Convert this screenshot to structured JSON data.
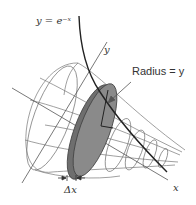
{
  "diagram": {
    "type": "solid-of-revolution",
    "labels": {
      "curve": "y = e⁻ˣ",
      "y_axis": "y",
      "x_axis": "x",
      "radius": "Radius = y",
      "delta_x": "Δx"
    },
    "colors": {
      "curve": "#222222",
      "wireframe": "#666666",
      "disk_fill": "#7a7a7a",
      "disk_edge": "#444444",
      "axis": "#555555",
      "text": "#333333"
    }
  }
}
